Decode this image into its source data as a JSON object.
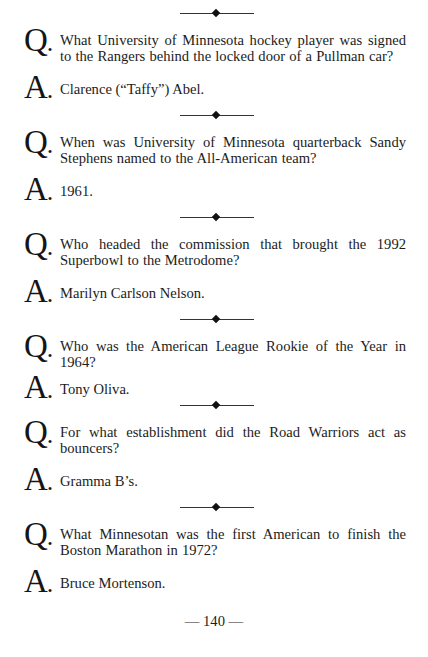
{
  "page": {
    "page_number": "— 140 —",
    "letters": {
      "question": "Q",
      "answer": "A",
      "dot": "."
    }
  },
  "items": [
    {
      "question": "What University of Minnesota hockey player was signed to the Rangers behind the locked door of a Pullman car?",
      "answer": "Clarence (“Taffy”) Abel."
    },
    {
      "question": "When was University of Minnesota quarterback Sandy Stephens named to the All-American team?",
      "answer": "1961."
    },
    {
      "question": "Who headed the commission that brought the 1992 Superbowl to the Metrodome?",
      "answer": "Marilyn Carlson Nelson."
    },
    {
      "question": "Who was the American League Rookie of the Year in 1964?",
      "answer": "Tony Oliva."
    },
    {
      "question": "For what establishment did the Road Warriors act as bouncers?",
      "answer": "Gramma B’s."
    },
    {
      "question": "What Minnesotan was the first American to finish the Boston Marathon in 1972?",
      "answer": "Bruce Mortenson."
    }
  ],
  "ornaments": {
    "divider_icon": "line-diamond-line"
  }
}
